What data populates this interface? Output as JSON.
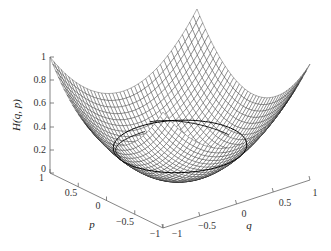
{
  "chart_data": {
    "type": "surface3d",
    "title": "",
    "function": "H(q,p) = (q^2 + p^2)/2 style bowl; value 1 at (q=-1,p=1)",
    "xlabel": "q",
    "ylabel": "p",
    "zlabel": "H(q, p)",
    "xlim": [
      -1,
      1
    ],
    "ylim": [
      -1,
      1
    ],
    "zlim": [
      0,
      1
    ],
    "x_ticks": [
      "-1",
      "-0.5",
      "0",
      "0.5",
      "1"
    ],
    "y_ticks": [
      "1",
      "0.5",
      "0",
      "-0.5",
      "-1"
    ],
    "z_ticks": [
      "0",
      "0.2",
      "0.4",
      "0.6",
      "0.8",
      "1"
    ],
    "grid": false,
    "mesh_color": "#000000",
    "surface_color": "#ffffff",
    "overlay_curves": [
      {
        "name": "level-set ellipse",
        "type": "closed-contour"
      },
      {
        "name": "trajectory arcs",
        "type": "intersecting-arcs"
      }
    ]
  },
  "axes": {
    "z_label": "H(q, p)",
    "p_label": "p",
    "q_label": "q",
    "z_ticks": [
      "1",
      "0.8",
      "0.6",
      "0.4",
      "0.2",
      "0"
    ],
    "p_ticks": [
      "1",
      "0.5",
      "0",
      "−0.5",
      "−1"
    ],
    "q_ticks": [
      "−1",
      "−0.5",
      "0",
      "0.5",
      "1"
    ]
  }
}
